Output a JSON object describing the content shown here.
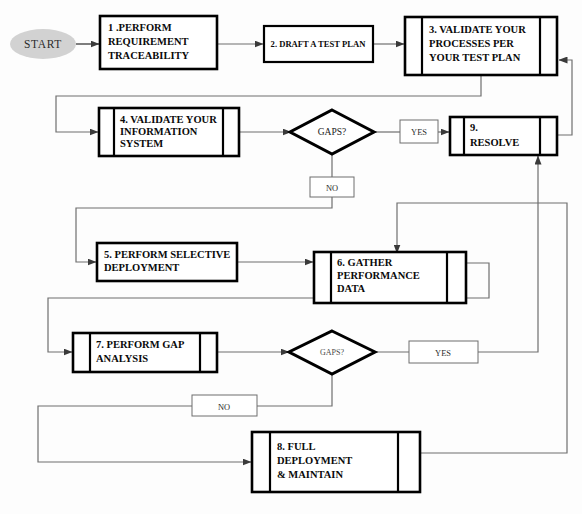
{
  "diagram": {
    "type": "flowchart",
    "background_color": "#fdfdfd",
    "line_color": "#6f6f6f",
    "node_border_color": "#000000",
    "start_fill_color": "#d2d2d2"
  },
  "nodes": {
    "start": {
      "label": "START",
      "shape": "ellipse"
    },
    "n1": {
      "line1": "1 .PERFORM",
      "line2": "REQUIREMENT",
      "line3": "TRACEABILITY",
      "shape": "process"
    },
    "n2": {
      "line1": "2. DRAFT A TEST PLAN",
      "shape": "process"
    },
    "n3": {
      "line1": "3. VALIDATE YOUR",
      "line2": "PROCESSES PER",
      "line3": "YOUR TEST PLAN",
      "shape": "predefined-process"
    },
    "n4": {
      "line1": "4. VALIDATE YOUR",
      "line2": "INFORMATION",
      "line3": "SYSTEM",
      "shape": "predefined-process"
    },
    "n5": {
      "line1": "5.  PERFORM SELECTIVE",
      "line2": "DEPLOYMENT",
      "shape": "process"
    },
    "n6": {
      "line1": "6. GATHER",
      "line2": "PERFORMANCE",
      "line3": "DATA",
      "shape": "predefined-process"
    },
    "n7": {
      "line1": "7. PERFORM GAP",
      "line2": "ANALYSIS",
      "shape": "predefined-process"
    },
    "n8": {
      "line1": "8. FULL",
      "line2": "DEPLOYMENT",
      "line3": "& MAINTAIN",
      "shape": "predefined-process"
    },
    "n9": {
      "line1": "9.",
      "line2": "RESOLVE",
      "shape": "predefined-process"
    },
    "d1": {
      "label": "GAPS?",
      "shape": "decision"
    },
    "d2": {
      "label": "GAPS?",
      "shape": "decision"
    }
  },
  "edge_labels": {
    "yes1": "YES",
    "no1": "NO",
    "yes2": "YES",
    "no2": "NO"
  },
  "flow_order": [
    "START",
    "1 .PERFORM REQUIREMENT TRACEABILITY",
    "2. DRAFT A TEST PLAN",
    "3. VALIDATE YOUR PROCESSES PER YOUR TEST PLAN",
    "4. VALIDATE YOUR INFORMATION SYSTEM",
    "GAPS?",
    "9. RESOLVE",
    "5.  PERFORM SELECTIVE DEPLOYMENT",
    "6. GATHER PERFORMANCE DATA",
    "7. PERFORM GAP ANALYSIS",
    "GAPS?",
    "8. FULL DEPLOYMENT & MAINTAIN"
  ]
}
